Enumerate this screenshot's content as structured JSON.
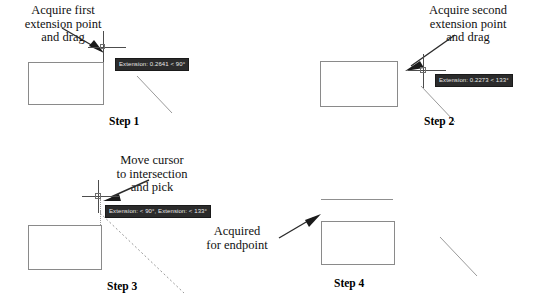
{
  "figure": {
    "background": "#ffffff",
    "line_color": "#8f8f8f",
    "tooltip_bg": "#2b2b2b",
    "tooltip_fg": "#e8e8e8"
  },
  "steps": [
    {
      "id": "step1",
      "label": "Step 1",
      "caption": [
        "Acquire first",
        "extension point",
        "and drag"
      ],
      "tooltip": "Extension: 0.2641 < 90°",
      "cursor_icon": "crosshair-cursor",
      "arrow_icon": "arrow-pointer-icon"
    },
    {
      "id": "step2",
      "label": "Step 2",
      "caption": [
        "Acquire second",
        "extension point",
        "and drag"
      ],
      "tooltip": "Extension: 0.2273 < 133°",
      "cursor_icon": "crosshair-cursor",
      "arrow_icon": "arrow-pointer-icon"
    },
    {
      "id": "step3",
      "label": "Step 3",
      "caption": [
        "Move cursor",
        "to intersection",
        "and pick"
      ],
      "tooltip": "Extension: < 90°, Extension: < 133°",
      "cursor_icon": "crosshair-cursor",
      "arrow_icon": "arrow-pointer-icon"
    },
    {
      "id": "step4",
      "label": "Step 4",
      "caption": [
        "Acquired",
        "for endpoint"
      ],
      "tooltip": null,
      "cursor_icon": null,
      "arrow_icon": "arrow-pointer-icon"
    }
  ]
}
